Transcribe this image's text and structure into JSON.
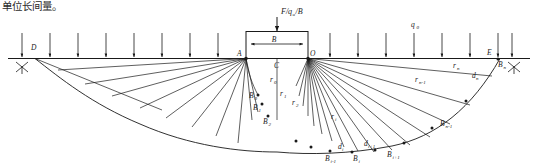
{
  "figure": {
    "caption_fragment": "单位长间量。",
    "ground_line_label": "",
    "load_formula": "F/q",
    "load_formula_sub": "u",
    "load_formula_tail": "/B",
    "footing_width_label": "B",
    "surcharge_label": "q",
    "surcharge_sub": "0",
    "points": {
      "D": "D",
      "A": "A",
      "C": "C",
      "O": "O",
      "E": "E"
    },
    "slip_points": [
      {
        "name": "B",
        "sub": "0"
      },
      {
        "name": "B",
        "sub": "1"
      },
      {
        "name": "B",
        "sub": "2"
      },
      {
        "name": "B",
        "sub": "i-1"
      },
      {
        "name": "B",
        "sub": "i"
      },
      {
        "name": "B",
        "sub": "i+1"
      },
      {
        "name": "B",
        "sub": "n-1"
      },
      {
        "name": "B",
        "sub": "n"
      }
    ],
    "radii": [
      {
        "name": "r",
        "sub": "0"
      },
      {
        "name": "r",
        "sub": "1"
      },
      {
        "name": "r",
        "sub": "2"
      },
      {
        "name": "r",
        "sub": "i"
      },
      {
        "name": "r",
        "sub": "n-1"
      },
      {
        "name": "r",
        "sub": "n"
      }
    ],
    "chords": [
      {
        "name": "d",
        "sub": "i"
      },
      {
        "name": "d",
        "sub": "i+1"
      },
      {
        "name": "d",
        "sub": "n"
      }
    ],
    "colors": {
      "line": "#1a1a1a",
      "text": "#1a1a1a",
      "background": "#ffffff"
    },
    "counts": {
      "left_arrows": 8,
      "right_arrows": 8,
      "left_rays": 11,
      "right_rays": 16
    }
  }
}
